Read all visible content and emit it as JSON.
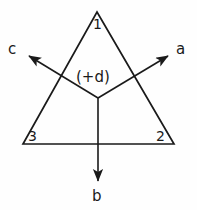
{
  "figure": {
    "background_color": "#fefefe",
    "stroke_color": "#1a1a1a",
    "labels": {
      "vertex_top": "1",
      "vertex_bottom_left": "3",
      "vertex_bottom_right": "2",
      "axis_left": "c",
      "axis_right": "a",
      "axis_down": "b",
      "center_annotation": "(+d)"
    },
    "geometry": {
      "triangle": {
        "apex": [
          97,
          12
        ],
        "bottom_left": [
          23,
          144
        ],
        "bottom_right": [
          174,
          144
        ]
      },
      "origin": [
        98,
        98
      ],
      "arrow_tip_left": [
        25,
        53
      ],
      "arrow_tip_right": [
        172,
        53
      ],
      "arrow_tip_down": [
        98,
        185
      ]
    }
  }
}
